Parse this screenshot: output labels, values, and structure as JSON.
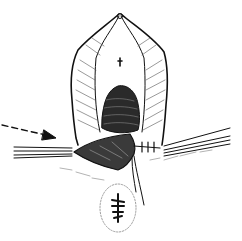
{
  "figure": {
    "type": "line-drawing illustration",
    "colors": {
      "ink": "#111111",
      "background": "#ffffff",
      "shade": "#444444"
    },
    "elements": [
      {
        "name": "dashed-arrow",
        "direction": "pointing right toward incision"
      },
      {
        "name": "left-retractor",
        "description": "instrument strands extending left"
      },
      {
        "name": "right-retractor",
        "description": "instrument strands extending right"
      },
      {
        "name": "sutures",
        "description": "interrupted stitches at right of wound"
      },
      {
        "name": "thread",
        "description": "suture threads hanging downward"
      },
      {
        "name": "lower-orifice",
        "description": "stellate opening at bottom"
      }
    ]
  }
}
